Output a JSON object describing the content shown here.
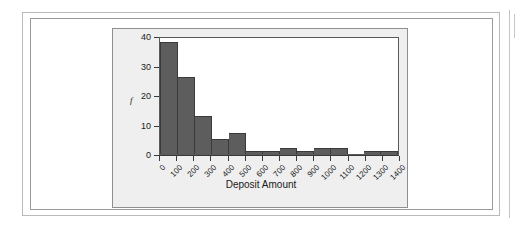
{
  "figure": {
    "panel_bg": "#efefef",
    "bar_color": "#5d5d5d",
    "plot_bg": "#ffffff",
    "y_axis_title": "f",
    "x_axis_title": "Deposit Amount"
  },
  "chart_data": {
    "type": "bar",
    "title": "",
    "subtitle": "",
    "xlabel": "Deposit Amount",
    "ylabel": "f",
    "grid": false,
    "legend": "none",
    "bin_width": 100,
    "bin_edges": [
      0,
      100,
      200,
      300,
      400,
      500,
      600,
      700,
      800,
      900,
      1000,
      1100,
      1200,
      1300,
      1400
    ],
    "categories": [
      "0-100",
      "100-200",
      "200-300",
      "300-400",
      "400-500",
      "500-600",
      "600-700",
      "700-800",
      "800-900",
      "900-1000",
      "1000-1100",
      "1100-1200",
      "1200-1300",
      "1300-1400"
    ],
    "values": [
      38,
      26,
      13,
      5,
      7,
      1,
      1,
      2,
      1,
      2,
      2,
      0,
      1,
      1
    ],
    "x_tick_labels": [
      "0",
      "100",
      "200",
      "300",
      "400",
      "500",
      "600",
      "700",
      "800",
      "900",
      "1000",
      "1100",
      "1200",
      "1300",
      "1400"
    ],
    "y_tick_labels": [
      "0",
      "10",
      "20",
      "30",
      "40"
    ],
    "y_ticks": [
      0,
      10,
      20,
      30,
      40
    ],
    "ylim": [
      0,
      40
    ],
    "xlim": [
      0,
      1400
    ]
  }
}
